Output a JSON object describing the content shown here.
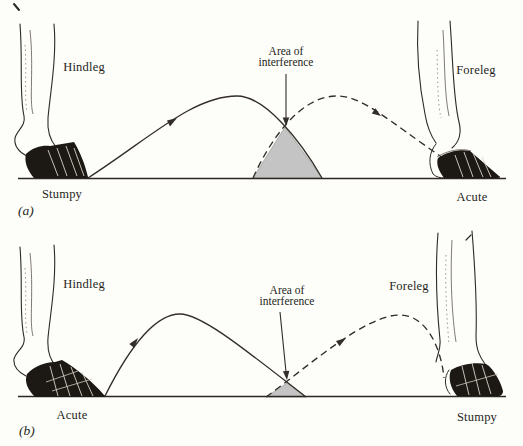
{
  "figure": {
    "description_type": "horse-gait-interference-diagram",
    "colors": {
      "background": "#fdfdf9",
      "line": "#332e29",
      "interference_shade": "#c4c4c4",
      "hoof_dark": "#1c1813",
      "text": "#241f1b"
    },
    "panels": [
      {
        "panel_label": "(a)",
        "hindleg_label": "Hindleg",
        "foreleg_label": "Foreleg",
        "interference_line1": "Area of",
        "interference_line2": "interference",
        "left_hoof_type": "Stumpy",
        "right_hoof_type": "Acute"
      },
      {
        "panel_label": "(b)",
        "hindleg_label": "Hindleg",
        "foreleg_label": "Foreleg",
        "interference_line1": "Area of",
        "interference_line2": "interference",
        "left_hoof_type": "Acute",
        "right_hoof_type": "Stumpy"
      }
    ]
  }
}
